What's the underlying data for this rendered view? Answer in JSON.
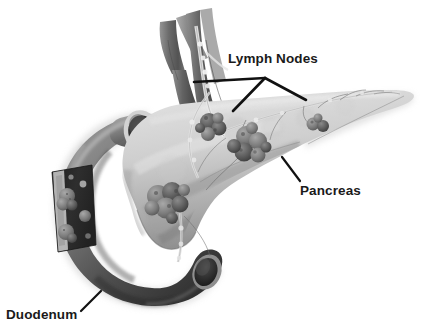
{
  "figure": {
    "background_color": "#ffffff",
    "width": 422,
    "height": 334,
    "style": "grayscale medical illustration"
  },
  "labels": {
    "lymph_nodes": "Lymph Nodes",
    "pancreas": "Pancreas",
    "duodenum": "Duodenum",
    "text_color": "#1a1a1a"
  },
  "leader_lines": {
    "lymph_nodes": {
      "origin_x": 265,
      "origin_y": 78,
      "endpoints": [
        {
          "x": 194,
          "y": 82
        },
        {
          "x": 233,
          "y": 111
        },
        {
          "x": 306,
          "y": 100
        }
      ],
      "color": "#111111"
    },
    "pancreas": {
      "from_x": 282,
      "from_y": 157,
      "to_x": 300,
      "to_y": 181,
      "color": "#111111"
    },
    "duodenum": {
      "from_x": 101,
      "from_y": 291,
      "to_x": 81,
      "to_y": 311,
      "color": "#111111"
    }
  },
  "structures": {
    "pancreas": {
      "name": "pancreas",
      "description": "Light gray organ extending from head at left to tapering tail at right",
      "fill_light": "#dcdcdc",
      "fill_mid": "#b4b4b4",
      "fill_dark": "#8d8d8d"
    },
    "duodenum": {
      "name": "duodenum",
      "description": "C-shaped dark gray tube curving around the pancreatic head with a cut-away window",
      "fill_light": "#a6a6a6",
      "fill_mid": "#6e6e6e",
      "fill_dark": "#2f2f2f",
      "window_fill": "#262626"
    },
    "vessels": {
      "name": "blood-vessels",
      "description": "Branching vascular trunks rising above the pancreas",
      "fill_light": "#9a9a9a",
      "fill_dark": "#4a4a4a"
    },
    "lymphatic_chain": {
      "name": "lymphatic-chain",
      "description": "Pale beaded lymphatic vessels running along the pancreas and vessels",
      "fill": "#efefef",
      "stroke": "#7a7a7a"
    },
    "lymph_node_clusters": [
      {
        "name": "peri-vascular-cluster",
        "cx": 212,
        "cy": 127,
        "r": 15
      },
      {
        "name": "pancreas-body-cluster",
        "cx": 250,
        "cy": 145,
        "r": 18
      },
      {
        "name": "pancreas-tail-cluster",
        "cx": 318,
        "cy": 124,
        "r": 10
      },
      {
        "name": "pancreatic-head-cluster",
        "cx": 170,
        "cy": 200,
        "r": 20
      },
      {
        "name": "duodenal-wall-nodes",
        "cx": 70,
        "cy": 210,
        "r": 16
      }
    ],
    "openings": [
      {
        "name": "duodenum-upper-lumen",
        "cx": 142,
        "cy": 132,
        "rx": 17,
        "ry": 21
      },
      {
        "name": "duodenum-lower-lumen",
        "cx": 207,
        "cy": 272,
        "rx": 13,
        "ry": 17
      }
    ]
  }
}
